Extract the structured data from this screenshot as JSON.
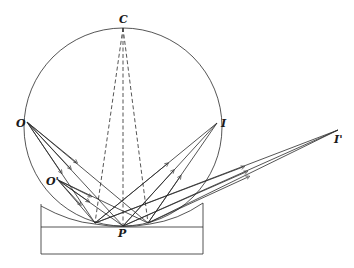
{
  "diagram": {
    "labels": {
      "C": "C",
      "O": "O",
      "O_prime": "O'",
      "I": "I",
      "I_prime": "I'",
      "P": "P"
    },
    "colors": {
      "line": "#2a2a2a",
      "background": "#ffffff"
    }
  }
}
